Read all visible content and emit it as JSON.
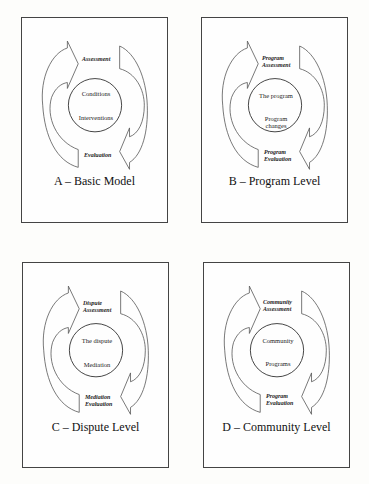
{
  "panels": [
    {
      "id": "A",
      "title": "A – Basic Model",
      "assessment_label": [
        "Assessment"
      ],
      "evaluation_label": [
        "Evaluation"
      ],
      "inner_top": [
        "Conditions"
      ],
      "inner_bottom": [
        "Interventions"
      ]
    },
    {
      "id": "B",
      "title": "B – Program Level",
      "assessment_label": [
        "Program",
        "Assessment"
      ],
      "evaluation_label": [
        "Program",
        "Evaluation"
      ],
      "inner_top": [
        "The program"
      ],
      "inner_bottom": [
        "Program",
        "changes"
      ]
    },
    {
      "id": "C",
      "title": "C – Dispute Level",
      "assessment_label": [
        "Dispute",
        "Assessment"
      ],
      "evaluation_label": [
        "Mediation",
        "Evaluation"
      ],
      "inner_top": [
        "The dispute"
      ],
      "inner_bottom": [
        "Mediation"
      ]
    },
    {
      "id": "D",
      "title": "D – Community Level",
      "assessment_label": [
        "Community",
        "Assessment"
      ],
      "evaluation_label": [
        "Program",
        "Evaluation"
      ],
      "inner_top": [
        "Community"
      ],
      "inner_bottom": [
        "Programs"
      ]
    }
  ]
}
